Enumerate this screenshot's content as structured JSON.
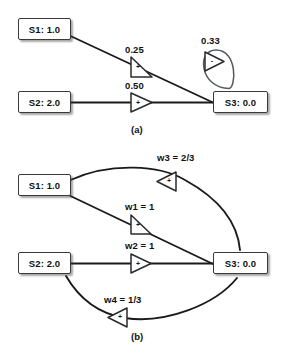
{
  "figure": {
    "panels": [
      {
        "id": "a",
        "caption": "(a)",
        "nodes": [
          {
            "name": "node-s1",
            "label": "S1: 1.0"
          },
          {
            "name": "node-s2",
            "label": "S2: 2.0"
          },
          {
            "name": "node-s3",
            "label": "S3: 0.0"
          }
        ],
        "edges": [
          {
            "name": "edge-s1-s3",
            "label": "0.25",
            "sign": "+",
            "from": "S1",
            "to": "S3",
            "gate_direction": "right"
          },
          {
            "name": "edge-s2-s3",
            "label": "0.50",
            "sign": "+",
            "from": "S2",
            "to": "S3",
            "gate_direction": "right"
          },
          {
            "name": "edge-s3-s3-selfloop",
            "label": "0.33",
            "sign": "-",
            "from": "S3",
            "to": "S3",
            "gate_direction": "right"
          }
        ]
      },
      {
        "id": "b",
        "caption": "(b)",
        "nodes": [
          {
            "name": "node-s1",
            "label": "S1: 1.0"
          },
          {
            "name": "node-s2",
            "label": "S2: 2.0"
          },
          {
            "name": "node-s3",
            "label": "S3: 0.0"
          }
        ],
        "edges": [
          {
            "name": "edge-w3",
            "label": "w3 = 2/3",
            "sign": "+",
            "from": "S3",
            "to": "S1",
            "gate_direction": "left"
          },
          {
            "name": "edge-w1",
            "label": "w1 = 1",
            "sign": "+",
            "from": "S1",
            "to": "S3",
            "gate_direction": "right"
          },
          {
            "name": "edge-w2",
            "label": "w2 = 1",
            "sign": "+",
            "from": "S2",
            "to": "S3",
            "gate_direction": "right"
          },
          {
            "name": "edge-w4",
            "label": "w4 = 1/3",
            "sign": "+",
            "from": "S3",
            "to": "S2",
            "gate_direction": "left"
          }
        ]
      }
    ]
  },
  "colors": {
    "background": "#ffffff",
    "stroke": "#1a1a1a",
    "text": "#111111",
    "node_fill": "#ffffff"
  }
}
